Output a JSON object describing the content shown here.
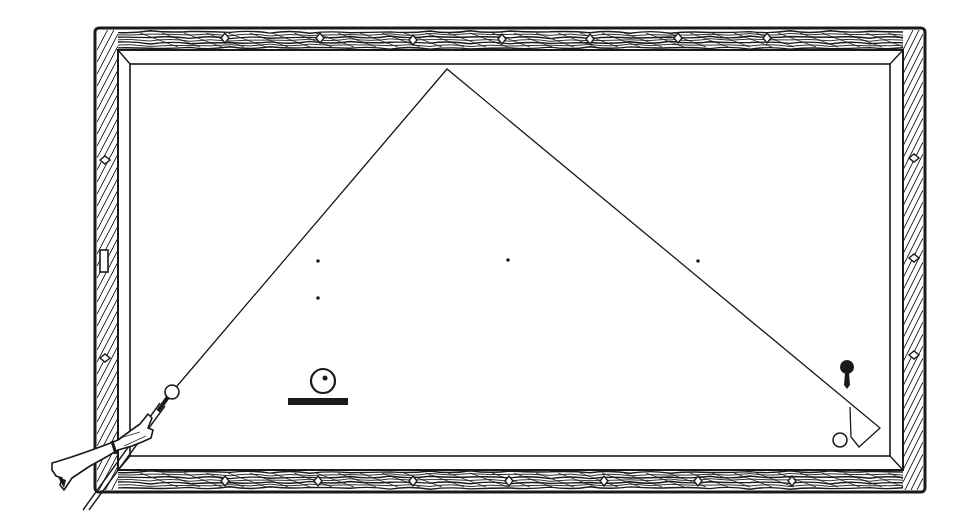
{
  "diagram": {
    "title": "Billiards diamond-system shot diagram",
    "colors": {
      "ink": "#1a1a1a",
      "paper": "#ffffff",
      "cloth": "#ffffff"
    },
    "table": {
      "outer": {
        "x": 95,
        "y": 28,
        "w": 830,
        "h": 464
      },
      "rail_inner": {
        "x": 118,
        "y": 50,
        "w": 785,
        "h": 420
      },
      "cushion": {
        "x": 130,
        "y": 64,
        "w": 760,
        "h": 392
      }
    },
    "diamonds": {
      "top": [
        [
          225,
          38
        ],
        [
          320,
          38
        ],
        [
          413,
          40
        ],
        [
          502,
          39
        ],
        [
          590,
          39
        ],
        [
          678,
          38
        ],
        [
          767,
          38
        ]
      ],
      "bottom": [
        [
          225,
          481
        ],
        [
          318,
          481
        ],
        [
          413,
          481
        ],
        [
          509,
          481
        ],
        [
          604,
          481
        ],
        [
          698,
          481
        ],
        [
          792,
          481
        ]
      ],
      "left": [
        [
          105,
          160
        ],
        [
          105,
          358
        ]
      ],
      "right": [
        [
          914,
          158
        ],
        [
          914,
          258
        ],
        [
          914,
          355
        ]
      ]
    },
    "left_rail_marker": {
      "x": 100,
      "y": 250,
      "w": 8,
      "h": 22
    },
    "cue_ball": {
      "x": 172,
      "y": 392,
      "r": 7,
      "label": "cue ball"
    },
    "object_ball_black": {
      "x": 847,
      "y": 367,
      "r": 7,
      "label": "object ball"
    },
    "second_ball": {
      "x": 840,
      "y": 440,
      "r": 7,
      "label": "second object ball"
    },
    "target_marker": {
      "x": 323,
      "y": 381,
      "r": 12,
      "bar": {
        "x": 288,
        "y": 398,
        "w": 60,
        "h": 7
      },
      "label": "marker ball"
    },
    "path": {
      "points": [
        [
          172,
          392
        ],
        [
          447,
          69
        ],
        [
          880,
          428
        ],
        [
          859,
          447
        ],
        [
          851,
          437
        ],
        [
          850,
          407
        ]
      ],
      "label": "cue ball path"
    },
    "spots": [
      [
        318,
        261
      ],
      [
        508,
        260
      ],
      [
        698,
        261
      ],
      [
        318,
        298
      ]
    ],
    "cue": {
      "tip": [
        162,
        405
      ],
      "butt": [
        85,
        510
      ]
    },
    "hand": {
      "label": "player hand holding cue"
    }
  }
}
